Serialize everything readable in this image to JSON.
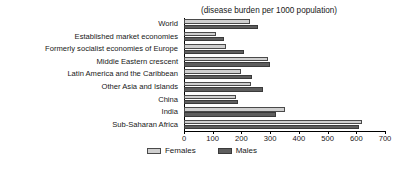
{
  "chart_data": {
    "type": "bar",
    "orientation": "horizontal",
    "title": "(disease burden per 1000 population)",
    "xlabel": "",
    "ylabel": "",
    "xlim": [
      0,
      700
    ],
    "xticks": [
      0,
      100,
      200,
      300,
      400,
      500,
      600,
      700
    ],
    "grid": false,
    "legend_position": "bottom-center",
    "categories": [
      "World",
      "Established market economies",
      "Formerly socialist economies of Europe",
      "Middle Eastern crescent",
      "Latin America and the Caribbean",
      "Other Asia and Islands",
      "China",
      "India",
      "Sub-Saharan Africa"
    ],
    "series": [
      {
        "name": "Females",
        "color": "#cfcfcf",
        "values": [
          230,
          110,
          148,
          292,
          198,
          235,
          180,
          350,
          620
        ]
      },
      {
        "name": "Males",
        "color": "#5e5e5e",
        "values": [
          258,
          141,
          210,
          300,
          237,
          275,
          188,
          320,
          610
        ]
      }
    ]
  },
  "legend": {
    "entries": [
      {
        "label": "Females",
        "swatch": "female"
      },
      {
        "label": "Males",
        "swatch": "male"
      }
    ]
  }
}
